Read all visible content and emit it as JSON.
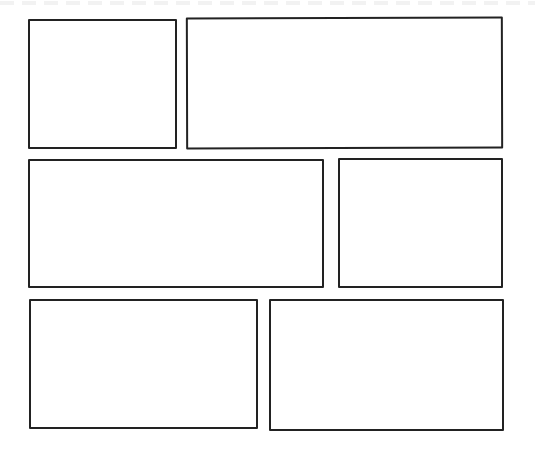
{
  "layout": {
    "type": "comic-panel-template",
    "rows": 3,
    "panel_count": 6,
    "border_color": "#222222",
    "background_color": "#ffffff"
  },
  "panels": [
    {
      "id": "p1",
      "row": 1,
      "position": "left",
      "content": ""
    },
    {
      "id": "p2",
      "row": 1,
      "position": "right",
      "content": ""
    },
    {
      "id": "p3",
      "row": 2,
      "position": "left",
      "content": ""
    },
    {
      "id": "p4",
      "row": 2,
      "position": "right",
      "content": ""
    },
    {
      "id": "p5",
      "row": 3,
      "position": "left",
      "content": ""
    },
    {
      "id": "p6",
      "row": 3,
      "position": "right",
      "content": ""
    }
  ]
}
